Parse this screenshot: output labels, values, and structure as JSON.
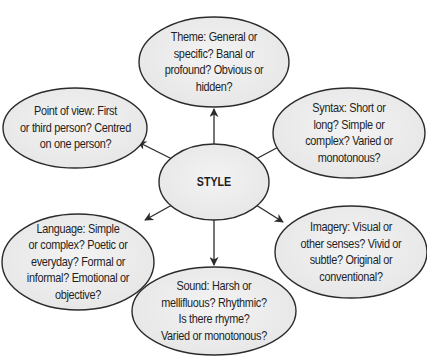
{
  "diagram": {
    "center": {
      "id": "style",
      "label": "STYLE"
    },
    "nodes": [
      {
        "id": "theme",
        "lines": [
          "Theme: General or",
          "specific? Banal or",
          "profound? Obvious or",
          "hidden?"
        ]
      },
      {
        "id": "point-of-view",
        "lines": [
          "Point of view: First",
          "or third person? Centred",
          "on one person?"
        ]
      },
      {
        "id": "syntax",
        "lines": [
          "Syntax: Short or",
          "long? Simple or",
          "complex? Varied or",
          "monotonous?"
        ]
      },
      {
        "id": "language",
        "lines": [
          "Language: Simple",
          "or complex? Poetic or",
          "everyday? Formal or",
          "informal? Emotional or",
          "objective?"
        ]
      },
      {
        "id": "imagery",
        "lines": [
          "Imagery: Visual or",
          "other senses? Vivid or",
          "subtle? Original or",
          "conventional?"
        ]
      },
      {
        "id": "sound",
        "lines": [
          "Sound: Harsh or",
          "mellifluous? Rhythmic?",
          "Is there rhyme?",
          "Varied or monotonous?"
        ]
      }
    ],
    "edges": [
      {
        "from": "style",
        "to": "theme"
      },
      {
        "from": "style",
        "to": "point-of-view"
      },
      {
        "from": "style",
        "to": "syntax"
      },
      {
        "from": "style",
        "to": "language"
      },
      {
        "from": "style",
        "to": "imagery"
      },
      {
        "from": "style",
        "to": "sound"
      }
    ],
    "colors": {
      "fill": "#ececec",
      "stroke": "#2b2b2b",
      "text": "#1f1f1f",
      "background": "#ffffff"
    }
  }
}
